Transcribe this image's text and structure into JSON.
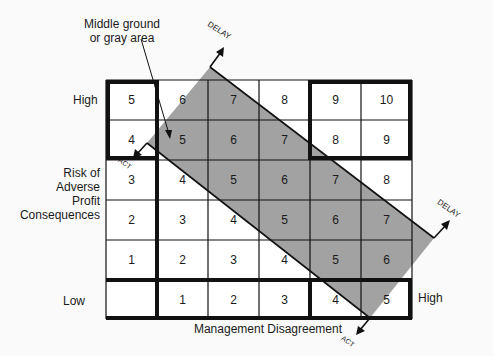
{
  "title_annotation": {
    "line1": "Middle ground",
    "line2": "or gray area"
  },
  "y_axis": {
    "label_lines": [
      "Risk of",
      "Adverse",
      "Profit",
      "Consequences"
    ],
    "high": "High",
    "low": "Low"
  },
  "x_axis": {
    "label": "Management Disagreement",
    "high": "High"
  },
  "arrows": {
    "delay_top": "DELAY",
    "delay_right": "DELAY",
    "act_left": "ACT",
    "act_bottom": "ACT"
  },
  "grid": {
    "rows": [
      [
        "5",
        "6",
        "7",
        "8",
        "9",
        "10"
      ],
      [
        "4",
        "5",
        "6",
        "7",
        "8",
        "9"
      ],
      [
        "3",
        "4",
        "5",
        "6",
        "7",
        "8"
      ],
      [
        "2",
        "3",
        "4",
        "5",
        "6",
        "7"
      ],
      [
        "1",
        "2",
        "3",
        "4",
        "5",
        "6"
      ],
      [
        "",
        "1",
        "2",
        "3",
        "4",
        "5"
      ]
    ]
  },
  "colors": {
    "gray_area": "#9a9a9a",
    "line": "#111111",
    "background": "#fafafa"
  }
}
